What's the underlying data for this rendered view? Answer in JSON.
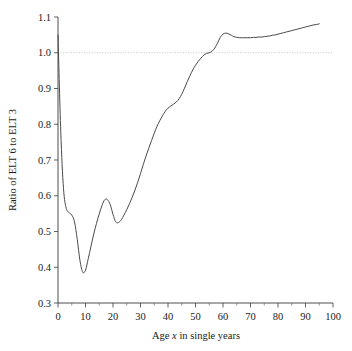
{
  "chart_data": {
    "type": "line",
    "title": "",
    "xlabel": "Age x in single years",
    "xlabel_prefix": "Age ",
    "xlabel_italic": "x",
    "xlabel_suffix": " in single years",
    "ylabel": "Ratio of ELT 6 to ELT 3",
    "xlim": [
      0,
      100
    ],
    "ylim": [
      0.3,
      1.1
    ],
    "xticks": [
      0,
      10,
      20,
      30,
      40,
      50,
      60,
      70,
      80,
      90,
      100
    ],
    "xtick_labels": [
      "0",
      "10",
      "20",
      "30",
      "40",
      "50",
      "60",
      "70",
      "80",
      "90",
      "100"
    ],
    "xticks_minor": [
      5,
      15,
      25,
      35,
      45,
      55,
      65,
      75,
      85,
      95
    ],
    "yticks": [
      0.3,
      0.4,
      0.5,
      0.6,
      0.7,
      0.8,
      0.9,
      1.0,
      1.1
    ],
    "ytick_labels": [
      "0.3",
      "0.4",
      "0.5",
      "0.6",
      "0.7",
      "0.8",
      "0.9",
      "1.0",
      "1.1"
    ],
    "grid": false,
    "legend": "none",
    "reference_lines": [
      {
        "axis": "y",
        "value": 1.0,
        "style": "dotted",
        "color": "#b9b9b9"
      }
    ],
    "series": [
      {
        "name": "Ratio of ELT 6 to ELT 3",
        "color": "#4a4a4a",
        "x": [
          0,
          1,
          2,
          3,
          4,
          5,
          6,
          7,
          8,
          9,
          10,
          11,
          12,
          13,
          14,
          15,
          16,
          17,
          18,
          19,
          20,
          21,
          22,
          23,
          24,
          25,
          26,
          27,
          28,
          29,
          30,
          31,
          32,
          33,
          34,
          35,
          36,
          37,
          38,
          39,
          40,
          41,
          42,
          43,
          44,
          45,
          46,
          47,
          48,
          49,
          50,
          51,
          52,
          53,
          54,
          55,
          56,
          57,
          58,
          59,
          60,
          61,
          62,
          63,
          64,
          65,
          66,
          67,
          68,
          69,
          70,
          71,
          72,
          73,
          74,
          75,
          76,
          77,
          78,
          79,
          80,
          81,
          82,
          83,
          84,
          85,
          86,
          87,
          88,
          89,
          90,
          91,
          92,
          93,
          94,
          95
        ],
        "y": [
          1.05,
          0.78,
          0.62,
          0.565,
          0.553,
          0.546,
          0.527,
          0.478,
          0.418,
          0.386,
          0.392,
          0.424,
          0.459,
          0.493,
          0.523,
          0.549,
          0.573,
          0.589,
          0.589,
          0.575,
          0.548,
          0.527,
          0.525,
          0.533,
          0.546,
          0.561,
          0.578,
          0.596,
          0.616,
          0.638,
          0.662,
          0.687,
          0.711,
          0.733,
          0.754,
          0.775,
          0.794,
          0.81,
          0.824,
          0.836,
          0.845,
          0.851,
          0.856,
          0.862,
          0.871,
          0.884,
          0.901,
          0.919,
          0.936,
          0.952,
          0.965,
          0.976,
          0.985,
          0.993,
          0.998,
          1.0,
          1.004,
          1.013,
          1.027,
          1.043,
          1.052,
          1.055,
          1.053,
          1.049,
          1.045,
          1.043,
          1.042,
          1.042,
          1.042,
          1.042,
          1.042,
          1.043,
          1.043,
          1.044,
          1.044,
          1.045,
          1.046,
          1.047,
          1.049,
          1.05,
          1.052,
          1.054,
          1.056,
          1.058,
          1.06,
          1.062,
          1.064,
          1.066,
          1.068,
          1.07,
          1.072,
          1.074,
          1.076,
          1.078,
          1.079,
          1.081
        ]
      }
    ],
    "annotations": [
      {
        "label": "global minimum",
        "x": 9,
        "y": 0.386
      },
      {
        "label": "local maximum",
        "x": 17,
        "y": 0.589
      },
      {
        "label": "local minimum",
        "x": 22,
        "y": 0.525
      },
      {
        "label": "crosses unity",
        "x": 55,
        "y": 1.0
      },
      {
        "label": "local peak",
        "x": 61,
        "y": 1.055
      }
    ]
  }
}
